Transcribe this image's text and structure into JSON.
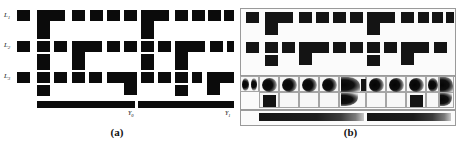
{
  "figure": {
    "panels": [
      {
        "id": "a",
        "caption": "(a)",
        "row_labels": [
          {
            "text": "L",
            "sub": "1"
          },
          {
            "text": "L",
            "sub": "2"
          },
          {
            "text": "L",
            "sub": "3"
          }
        ],
        "bar_labels": [
          {
            "text": "Y",
            "sub": "0"
          },
          {
            "text": "Y",
            "sub": "1"
          }
        ]
      },
      {
        "id": "b",
        "caption": "(b)",
        "row_labels": [],
        "bar_labels": []
      }
    ],
    "colors": {
      "ink": "#0b0b0b",
      "background": "#ffffff",
      "frame": "#9a9a9a",
      "cell_border": "#a5a5a5",
      "smudge_dark": "#050505",
      "smudge_light": "#f2f2f2"
    }
  }
}
